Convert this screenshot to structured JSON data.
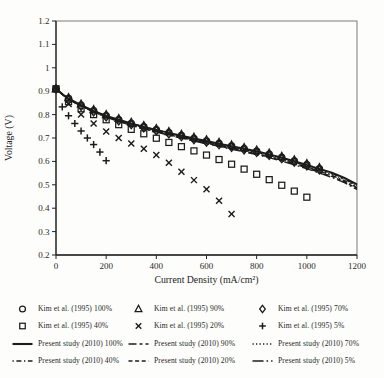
{
  "figure": {
    "background": "#fdfdfb",
    "ink_color": "#1c1c1c",
    "frame_color": "#6e6e6e"
  },
  "chart_data": {
    "type": "line+scatter",
    "title": "",
    "xlabel": "Current Density (mA/cm²)",
    "ylabel": "Voltage (V)",
    "xlim": [
      0,
      1200
    ],
    "ylim": [
      0.2,
      1.2
    ],
    "grid": false,
    "legend_position": "below",
    "x_ticks": [
      {
        "v": 0,
        "label": "0"
      },
      {
        "v": 200,
        "label": "200"
      },
      {
        "v": 400,
        "label": "400"
      },
      {
        "v": 600,
        "label": "600"
      },
      {
        "v": 800,
        "label": "800"
      },
      {
        "v": 1000,
        "label": "1000"
      },
      {
        "v": 1200,
        "label": "1200"
      }
    ],
    "y_ticks": [
      {
        "v": 0.2,
        "label": "0.2"
      },
      {
        "v": 0.3,
        "label": "0.3"
      },
      {
        "v": 0.4,
        "label": "0.4"
      },
      {
        "v": 0.5,
        "label": "0.5"
      },
      {
        "v": 0.6,
        "label": "0.6"
      },
      {
        "v": 0.7,
        "label": "0.7"
      },
      {
        "v": 0.8,
        "label": "0.8"
      },
      {
        "v": 0.9,
        "label": "0.9"
      },
      {
        "v": 1.0,
        "label": "1"
      },
      {
        "v": 1.1,
        "label": "1.1"
      },
      {
        "v": 1.2,
        "label": "1.2"
      }
    ],
    "series": [
      {
        "id": "kim100",
        "label": "Kim et al. (1995) 100%",
        "render": "markers",
        "marker": "circle",
        "x": [
          0,
          50,
          100,
          150,
          200,
          250,
          300,
          350,
          400,
          450,
          500,
          550,
          600,
          650,
          700,
          750,
          800,
          850,
          900,
          950,
          1000,
          1050
        ],
        "y": [
          0.91,
          0.868,
          0.84,
          0.816,
          0.795,
          0.778,
          0.762,
          0.748,
          0.735,
          0.722,
          0.71,
          0.698,
          0.687,
          0.676,
          0.665,
          0.654,
          0.643,
          0.63,
          0.616,
          0.601,
          0.585,
          0.568
        ]
      },
      {
        "id": "kim90",
        "label": "Kim et al. (1995) 90%",
        "render": "markers",
        "marker": "triangle",
        "x": [
          0,
          50,
          100,
          150,
          200,
          250,
          300,
          350,
          400,
          450,
          500,
          550,
          600,
          650,
          700,
          750,
          800,
          850,
          900,
          950,
          1000,
          1050
        ],
        "y": [
          0.91,
          0.872,
          0.845,
          0.821,
          0.8,
          0.783,
          0.767,
          0.753,
          0.74,
          0.727,
          0.715,
          0.703,
          0.692,
          0.681,
          0.67,
          0.659,
          0.648,
          0.635,
          0.621,
          0.606,
          0.59,
          0.573
        ]
      },
      {
        "id": "kim70",
        "label": "Kim et al. (1995) 70%",
        "render": "markers",
        "marker": "diamond",
        "x": [
          0,
          50,
          100,
          150,
          200,
          250,
          300,
          350,
          400,
          450,
          500,
          550,
          600,
          650,
          700,
          750,
          800,
          850,
          900,
          950,
          1000,
          1050
        ],
        "y": [
          0.908,
          0.863,
          0.835,
          0.811,
          0.79,
          0.773,
          0.757,
          0.743,
          0.73,
          0.717,
          0.705,
          0.693,
          0.682,
          0.671,
          0.66,
          0.649,
          0.638,
          0.625,
          0.611,
          0.596,
          0.58,
          0.563
        ]
      },
      {
        "id": "kim40",
        "label": "Kim et al. (1995) 40%",
        "render": "markers",
        "marker": "square",
        "x": [
          0,
          50,
          100,
          150,
          200,
          250,
          300,
          350,
          400,
          450,
          500,
          550,
          600,
          650,
          700,
          750,
          800,
          850,
          900,
          950,
          1000
        ],
        "y": [
          0.91,
          0.855,
          0.825,
          0.8,
          0.778,
          0.757,
          0.737,
          0.718,
          0.699,
          0.681,
          0.663,
          0.645,
          0.627,
          0.608,
          0.588,
          0.567,
          0.545,
          0.522,
          0.498,
          0.473,
          0.447
        ]
      },
      {
        "id": "kim20",
        "label": "Kim et al. (1995) 20%",
        "render": "markers",
        "marker": "x",
        "x": [
          0,
          50,
          100,
          150,
          200,
          250,
          300,
          350,
          400,
          450,
          500,
          550,
          600,
          650,
          700
        ],
        "y": [
          0.91,
          0.845,
          0.8,
          0.762,
          0.728,
          0.7,
          0.676,
          0.654,
          0.627,
          0.594,
          0.556,
          0.52,
          0.481,
          0.432,
          0.375
        ]
      },
      {
        "id": "kim5",
        "label": "Kim et al. (1995) 5%",
        "render": "markers",
        "marker": "plus",
        "x": [
          0,
          25,
          50,
          75,
          100,
          125,
          150,
          175,
          200
        ],
        "y": [
          0.91,
          0.833,
          0.795,
          0.762,
          0.73,
          0.7,
          0.672,
          0.64,
          0.603
        ]
      },
      {
        "id": "p5",
        "label": "Present study (2010) 5%",
        "render": "line",
        "dash": "11 3 1.6 3",
        "width": 1.4,
        "x": [
          0,
          25,
          50,
          100,
          150,
          200,
          250,
          300,
          350,
          400,
          450,
          500,
          550,
          600,
          650,
          700,
          750,
          800,
          850,
          900,
          950,
          1000,
          1050,
          1100,
          1150,
          1200
        ],
        "y": [
          0.91,
          0.886,
          0.865,
          0.836,
          0.811,
          0.789,
          0.771,
          0.754,
          0.739,
          0.726,
          0.712,
          0.7,
          0.687,
          0.675,
          0.664,
          0.652,
          0.641,
          0.629,
          0.616,
          0.601,
          0.585,
          0.569,
          0.55,
          0.532,
          0.509,
          0.48
        ]
      },
      {
        "id": "p20",
        "label": "Present study (2010) 20%",
        "render": "line",
        "dash": "4 2.6",
        "width": 1.4,
        "x": [
          0,
          25,
          50,
          100,
          150,
          200,
          250,
          300,
          350,
          400,
          450,
          500,
          550,
          600,
          650,
          700,
          750,
          800,
          850,
          900,
          950,
          1000,
          1050,
          1100,
          1150,
          1200
        ],
        "y": [
          0.91,
          0.886,
          0.866,
          0.837,
          0.812,
          0.79,
          0.772,
          0.756,
          0.741,
          0.728,
          0.714,
          0.702,
          0.69,
          0.678,
          0.666,
          0.655,
          0.644,
          0.632,
          0.619,
          0.604,
          0.589,
          0.572,
          0.554,
          0.536,
          0.513,
          0.484
        ]
      },
      {
        "id": "p40",
        "label": "Present study (2010) 40%",
        "render": "line",
        "dash": "1.3 2.6 5 2.6",
        "width": 1.4,
        "x": [
          0,
          25,
          50,
          100,
          150,
          200,
          250,
          300,
          350,
          400,
          450,
          500,
          550,
          600,
          650,
          700,
          750,
          800,
          850,
          900,
          950,
          1000,
          1050,
          1100,
          1150,
          1200
        ],
        "y": [
          0.91,
          0.887,
          0.866,
          0.838,
          0.813,
          0.792,
          0.774,
          0.758,
          0.743,
          0.73,
          0.717,
          0.704,
          0.692,
          0.68,
          0.669,
          0.658,
          0.647,
          0.635,
          0.622,
          0.608,
          0.592,
          0.576,
          0.558,
          0.54,
          0.517,
          0.488
        ]
      },
      {
        "id": "p70",
        "label": "Present study (2010) 70%",
        "render": "line",
        "dash": "1.3 2.2",
        "width": 1.4,
        "x": [
          0,
          25,
          50,
          100,
          150,
          200,
          250,
          300,
          350,
          400,
          450,
          500,
          550,
          600,
          650,
          700,
          750,
          800,
          850,
          900,
          950,
          1000,
          1050,
          1100,
          1150,
          1200
        ],
        "y": [
          0.91,
          0.887,
          0.867,
          0.839,
          0.814,
          0.793,
          0.776,
          0.76,
          0.745,
          0.732,
          0.719,
          0.706,
          0.694,
          0.683,
          0.672,
          0.661,
          0.65,
          0.638,
          0.625,
          0.611,
          0.596,
          0.58,
          0.562,
          0.545,
          0.522,
          0.493
        ]
      },
      {
        "id": "p90",
        "label": "Present study (2010) 90%",
        "render": "line",
        "dash": "8 3 3 3",
        "width": 1.5,
        "x": [
          0,
          25,
          50,
          100,
          150,
          200,
          250,
          300,
          350,
          400,
          450,
          500,
          550,
          600,
          650,
          700,
          750,
          800,
          850,
          900,
          950,
          1000,
          1050,
          1100,
          1150,
          1200
        ],
        "y": [
          0.91,
          0.888,
          0.868,
          0.84,
          0.815,
          0.794,
          0.777,
          0.761,
          0.747,
          0.734,
          0.721,
          0.708,
          0.696,
          0.685,
          0.674,
          0.663,
          0.652,
          0.641,
          0.628,
          0.614,
          0.599,
          0.583,
          0.565,
          0.549,
          0.526,
          0.498
        ]
      },
      {
        "id": "p100",
        "label": "Present study (2010) 100%",
        "render": "line",
        "dash": "",
        "width": 1.9,
        "x": [
          0,
          25,
          50,
          100,
          150,
          200,
          250,
          300,
          350,
          400,
          450,
          500,
          550,
          600,
          650,
          700,
          750,
          800,
          850,
          900,
          950,
          1000,
          1050,
          1100,
          1150,
          1200
        ],
        "y": [
          0.91,
          0.888,
          0.868,
          0.84,
          0.816,
          0.795,
          0.778,
          0.762,
          0.748,
          0.735,
          0.722,
          0.71,
          0.698,
          0.687,
          0.676,
          0.665,
          0.654,
          0.643,
          0.63,
          0.616,
          0.601,
          0.585,
          0.568,
          0.552,
          0.53,
          0.502
        ]
      }
    ]
  },
  "legend": {
    "columns": [
      [
        {
          "swatch": "marker",
          "marker": "circle",
          "label": "Kim et al. (1995) 100%"
        },
        {
          "swatch": "marker",
          "marker": "square",
          "label": "Kim et al. (1995) 40%"
        },
        {
          "swatch": "line",
          "dash": "",
          "label": "Present study (2010) 100%"
        },
        {
          "swatch": "line",
          "dash": "1.3 2.6 5 2.6",
          "label": "Present study (2010) 40%"
        }
      ],
      [
        {
          "swatch": "marker",
          "marker": "triangle",
          "label": "Kim et al. (1995) 90%"
        },
        {
          "swatch": "marker",
          "marker": "x",
          "label": "Kim et al. (1995) 20%"
        },
        {
          "swatch": "line",
          "dash": "8 3 3 3",
          "label": "Present study (2010) 90%"
        },
        {
          "swatch": "line",
          "dash": "4 2.6",
          "label": "Present study (2010) 20%"
        }
      ],
      [
        {
          "swatch": "marker",
          "marker": "diamond",
          "label": "Kim et al. (1995) 70%"
        },
        {
          "swatch": "marker",
          "marker": "plus",
          "label": "Kim et al. (1995) 5%"
        },
        {
          "swatch": "line",
          "dash": "1.3 2.2",
          "label": "Present study (2010) 70%"
        },
        {
          "swatch": "line",
          "dash": "11 3 1.6 3",
          "label": "Present study (2010) 5%"
        }
      ]
    ]
  }
}
